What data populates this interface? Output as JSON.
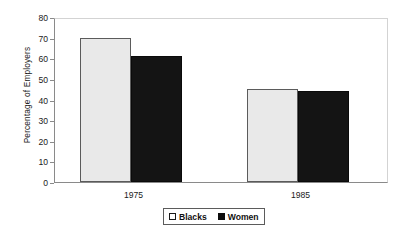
{
  "chart_data": {
    "type": "bar",
    "title": "",
    "xlabel": "",
    "ylabel": "Percentage of Employers",
    "categories": [
      "1975",
      "1985"
    ],
    "series": [
      {
        "name": "Blacks",
        "values": [
          70,
          45
        ],
        "color": "#e9e9e9"
      },
      {
        "name": "Women",
        "values": [
          61,
          44
        ],
        "color": "#141414"
      }
    ],
    "ylim": [
      0,
      80
    ],
    "ytick_step": 10,
    "yticks": [
      "80",
      "70",
      "60",
      "50",
      "40",
      "30",
      "20",
      "10",
      "0"
    ],
    "grid": false,
    "legend_position": "bottom-center"
  },
  "axis": {
    "y_title": "Percentage of Employers"
  },
  "legend": {
    "items": [
      {
        "label": "Blacks",
        "swatch": "light-square-icon"
      },
      {
        "label": "Women",
        "swatch": "dark-square-icon"
      }
    ]
  }
}
